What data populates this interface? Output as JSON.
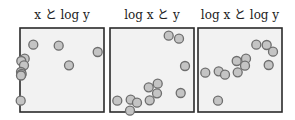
{
  "colors": {
    "panel_bg": "#f2f2f2",
    "panel_border": "#2a2a2a",
    "point_fill": "#c4c4c4",
    "point_stroke": "#6e6e6e"
  },
  "chart_data": [
    {
      "type": "scatter",
      "title": "x と log y",
      "xlabel": "",
      "ylabel": "",
      "grid": false,
      "points_px": [
        [
          33.3,
          44.7
        ],
        [
          58.7,
          45.7
        ],
        [
          97.7,
          52
        ],
        [
          24.7,
          58.7
        ],
        [
          21.3,
          61
        ],
        [
          24,
          65.3
        ],
        [
          69,
          65.3
        ],
        [
          21,
          72
        ],
        [
          21.7,
          74
        ],
        [
          21,
          75.5
        ],
        [
          20.7,
          100.7
        ]
      ],
      "panel_px": {
        "x": 20,
        "y": 28,
        "w": 84,
        "h": 84
      }
    },
    {
      "type": "scatter",
      "title": "log x と y",
      "xlabel": "",
      "ylabel": "",
      "grid": false,
      "points_px": [
        [
          168.7,
          35.7
        ],
        [
          179,
          38.7
        ],
        [
          185,
          66
        ],
        [
          157.7,
          83.7
        ],
        [
          148.7,
          87.3
        ],
        [
          157,
          93.3
        ],
        [
          180.7,
          93
        ],
        [
          117.3,
          100.7
        ],
        [
          130.7,
          99.7
        ],
        [
          137,
          102.7
        ],
        [
          149.7,
          100.3
        ],
        [
          130,
          110.7
        ]
      ],
      "panel_px": {
        "x": 110,
        "y": 28,
        "w": 84,
        "h": 84
      }
    },
    {
      "type": "scatter",
      "title": "log x と log y",
      "xlabel": "",
      "ylabel": "",
      "grid": false,
      "points_px": [
        [
          256.3,
          44.7
        ],
        [
          266.7,
          45
        ],
        [
          273,
          51.7
        ],
        [
          246,
          58.7
        ],
        [
          236.7,
          61
        ],
        [
          245,
          65.7
        ],
        [
          268.7,
          65
        ],
        [
          205.3,
          72.7
        ],
        [
          218.7,
          71.3
        ],
        [
          225,
          74.7
        ],
        [
          237.7,
          72.3
        ],
        [
          218,
          100.7
        ]
      ],
      "panel_px": {
        "x": 198,
        "y": 28,
        "w": 84,
        "h": 84
      }
    }
  ]
}
